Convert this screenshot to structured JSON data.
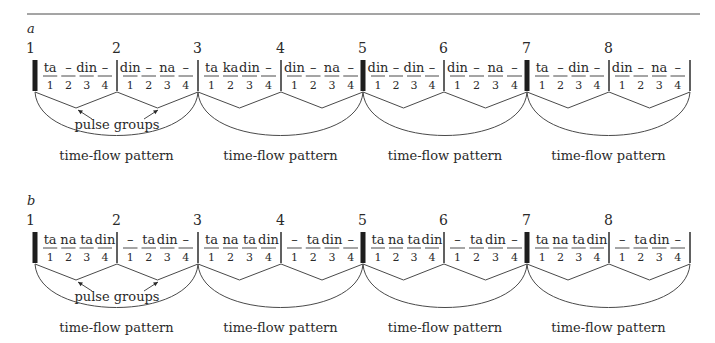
{
  "figure": {
    "rule": {
      "x1": 27,
      "x2": 700,
      "y": 14
    },
    "labels": {
      "pulse_groups": "pulse groups",
      "time_flow": "time-flow pattern"
    },
    "bar_x": [
      35,
      117,
      198,
      281,
      363,
      444,
      527,
      609,
      690
    ],
    "thick_bars": [
      0,
      4,
      6
    ],
    "measure_numbers": [
      "1",
      "2",
      "3",
      "4",
      "5",
      "6",
      "7",
      "8"
    ],
    "counts": [
      "1",
      "2",
      "3",
      "4"
    ],
    "sections": [
      {
        "id": "a",
        "title": "a",
        "y_offset": 0,
        "measures": [
          [
            "ta",
            "–",
            "din",
            "–"
          ],
          [
            "din",
            "–",
            "na",
            "–"
          ],
          [
            "ta",
            "ka",
            "din",
            "–"
          ],
          [
            "din",
            "–",
            "na",
            "–"
          ],
          [
            "din",
            "–",
            "din",
            "–"
          ],
          [
            "din",
            "–",
            "na",
            "–"
          ],
          [
            "ta",
            "–",
            "din",
            "–"
          ],
          [
            "din",
            "–",
            "na",
            "–"
          ]
        ]
      },
      {
        "id": "b",
        "title": "b",
        "y_offset": 172,
        "measures": [
          [
            "ta",
            "na",
            "ta",
            "din"
          ],
          [
            "–",
            "ta",
            "din",
            "–"
          ],
          [
            "ta",
            "na",
            "ta",
            "din"
          ],
          [
            "–",
            "ta",
            "din",
            "–"
          ],
          [
            "ta",
            "na",
            "ta",
            "din"
          ],
          [
            "–",
            "ta",
            "din",
            "–"
          ],
          [
            "ta",
            "na",
            "ta",
            "din"
          ],
          [
            "–",
            "ta",
            "din",
            "–"
          ]
        ]
      }
    ]
  }
}
